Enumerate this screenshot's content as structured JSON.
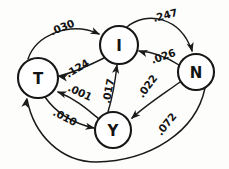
{
  "diagram": {
    "type": "state-transition-diagram",
    "title": "",
    "background_color": "#fdfdfb",
    "ink_color": "#1a1a1a",
    "nodes": [
      {
        "id": "T",
        "label": "T",
        "cx": 38,
        "cy": 78,
        "r": 20
      },
      {
        "id": "I",
        "label": "I",
        "cx": 119,
        "cy": 45,
        "r": 19
      },
      {
        "id": "N",
        "label": "N",
        "cx": 196,
        "cy": 72,
        "r": 18
      },
      {
        "id": "Y",
        "label": "Y",
        "cx": 113,
        "cy": 130,
        "r": 18
      }
    ],
    "edges": [
      {
        "id": "t-to-i",
        "from": "T",
        "to": "I",
        "weight": ".030",
        "label_x": 62,
        "label_y": 27,
        "label_rotate": -22,
        "path": "M 28 59 C 36 35, 70 21, 99 34",
        "arrow_x": 100,
        "arrow_y": 34.5,
        "arrow_angle": 25
      },
      {
        "id": "i-to-t",
        "from": "I",
        "to": "T",
        "weight": ".124",
        "label_x": 77,
        "label_y": 68,
        "label_rotate": -31,
        "path": "M 104 58 C 92 64, 76 72, 59 76",
        "arrow_x": 58,
        "arrow_y": 76.2,
        "arrow_angle": 190
      },
      {
        "id": "i-to-n",
        "from": "I",
        "to": "N",
        "weight": ".247",
        "label_x": 165,
        "label_y": 15,
        "label_rotate": -15,
        "path": "M 127 27 C 146 11, 180 16, 192 51",
        "arrow_x": 192.5,
        "arrow_y": 52,
        "arrow_angle": 75
      },
      {
        "id": "n-to-i",
        "from": "N",
        "to": "I",
        "weight": ".026",
        "label_x": 163,
        "label_y": 56,
        "label_rotate": -19,
        "path": "M 179 65 C 168 58, 155 52, 139 51",
        "arrow_x": 138,
        "arrow_y": 50.8,
        "arrow_angle": 196
      },
      {
        "id": "y-to-i",
        "from": "Y",
        "to": "I",
        "weight": ".017",
        "label_x": 108,
        "label_y": 91,
        "label_rotate": -79,
        "path": "M 108 112 C 111 102, 115 84, 117 65",
        "arrow_x": 117.2,
        "arrow_y": 64,
        "arrow_angle": -80
      },
      {
        "id": "n-to-y",
        "from": "N",
        "to": "Y",
        "weight": ".022",
        "label_x": 147,
        "label_y": 86,
        "label_rotate": -53,
        "path": "M 180 82 C 165 93, 146 105, 132 118",
        "arrow_x": 131,
        "arrow_y": 119,
        "arrow_angle": 137
      },
      {
        "id": "y-to-t",
        "from": "Y",
        "to": "T",
        "weight": ".001",
        "label_x": 80,
        "label_y": 92,
        "label_rotate": 25,
        "path": "M 99 119 C 88 110, 76 99, 58 92",
        "arrow_x": 57,
        "arrow_y": 91.6,
        "arrow_angle": 200
      },
      {
        "id": "t-to-y",
        "from": "T",
        "to": "Y",
        "weight": ".010",
        "label_x": 65,
        "label_y": 117,
        "label_rotate": 28,
        "path": "M 45 97 C 56 113, 72 123, 94 128",
        "arrow_x": 95,
        "arrow_y": 128.2,
        "arrow_angle": 12
      },
      {
        "id": "n-to-t",
        "from": "N",
        "to": "T",
        "weight": ".072",
        "label_x": 166,
        "label_y": 124,
        "label_rotate": -51,
        "path": "M 205 88 C 196 132, 150 161, 96 162 C 62 162, 34 136, 27 99",
        "arrow_x": 26.6,
        "arrow_y": 98,
        "arrow_angle": -80
      }
    ]
  }
}
